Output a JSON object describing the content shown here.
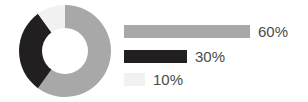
{
  "chart_data": {
    "type": "pie",
    "variant": "donut",
    "title": "",
    "subtitle": "",
    "xlabel": "",
    "ylabel": "",
    "grid": false,
    "legend_position": "right",
    "legend_style": "horizontal-bars",
    "units": "percent",
    "total": 100,
    "start_angle_deg": 0,
    "direction": "clockwise",
    "inner_radius_ratio": 0.48,
    "categories": [
      "60%",
      "30%",
      "10%"
    ],
    "values": [
      60,
      30,
      10
    ],
    "slices": [
      {
        "label": "60%",
        "value": 60,
        "color": "#a8a8a8",
        "bar_length_px": 126,
        "start_angle_deg": 0,
        "end_angle_deg": 216
      },
      {
        "label": "30%",
        "value": 30,
        "color": "#211f1f",
        "bar_length_px": 63,
        "start_angle_deg": 216,
        "end_angle_deg": 324
      },
      {
        "label": "10%",
        "value": 10,
        "color": "#f1f1f1",
        "bar_length_px": 21,
        "start_angle_deg": 324,
        "end_angle_deg": 360
      }
    ]
  },
  "legend": {
    "items": [
      {
        "label": "60%",
        "color": "#a8a8a8",
        "bar_length_px": 126
      },
      {
        "label": "30%",
        "color": "#211f1f",
        "bar_length_px": 63
      },
      {
        "label": "10%",
        "color": "#f1f1f1",
        "bar_length_px": 21
      }
    ]
  },
  "colors": {
    "background": "#ffffff",
    "slice_large": "#a8a8a8",
    "slice_medium": "#211f1f",
    "slice_small": "#f1f1f1",
    "label_text": "#4a4a4a"
  }
}
